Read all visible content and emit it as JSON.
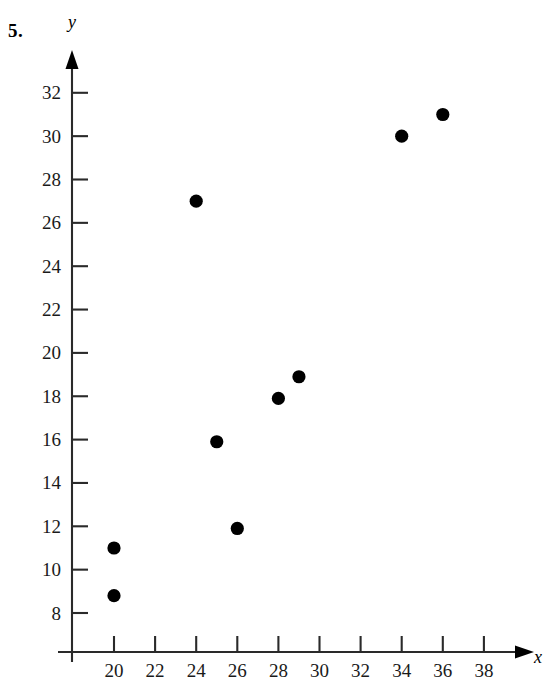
{
  "problem": {
    "number": "5."
  },
  "chart_data": {
    "type": "scatter",
    "title": "",
    "xlabel": "x",
    "ylabel": "y",
    "xlim": [
      18,
      39
    ],
    "ylim": [
      6,
      33
    ],
    "x_ticks": [
      20,
      22,
      24,
      26,
      28,
      30,
      32,
      34,
      36,
      38
    ],
    "y_ticks": [
      8,
      10,
      12,
      14,
      16,
      18,
      20,
      22,
      24,
      26,
      28,
      30,
      32
    ],
    "x_tick_labels": [
      "20",
      "22",
      "24",
      "26",
      "28",
      "30",
      "32",
      "34",
      "36",
      "38"
    ],
    "y_tick_labels": [
      "8",
      "10",
      "12",
      "14",
      "16",
      "18",
      "20",
      "22",
      "24",
      "26",
      "28",
      "30",
      "32"
    ],
    "grid": false,
    "legend": false,
    "marker": "filled-circle",
    "marker_color": "#000000",
    "points": [
      {
        "x": 20,
        "y": 8.8
      },
      {
        "x": 20,
        "y": 11
      },
      {
        "x": 24,
        "y": 27
      },
      {
        "x": 25,
        "y": 15.9
      },
      {
        "x": 26,
        "y": 11.9
      },
      {
        "x": 28,
        "y": 17.9
      },
      {
        "x": 29,
        "y": 18.9
      },
      {
        "x": 34,
        "y": 30
      },
      {
        "x": 36,
        "y": 31
      }
    ]
  }
}
